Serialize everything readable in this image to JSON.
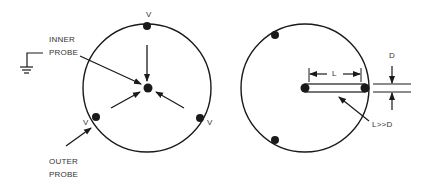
{
  "figure": {
    "left_panel": {
      "labels": {
        "v_top": "V",
        "v_left": "V",
        "v_right": "V",
        "inner_probe_line1": "INNER",
        "inner_probe_line2": "PROBE",
        "outer_probe_line1": "OUTER",
        "outer_probe_line2": "PROBE"
      },
      "icons": [
        "ground-icon"
      ]
    },
    "right_panel": {
      "labels": {
        "length": "L",
        "diameter": "D",
        "ratio": "L>>D"
      }
    },
    "colors": {
      "stroke": "#1a1a1a",
      "background": "#ffffff"
    }
  }
}
